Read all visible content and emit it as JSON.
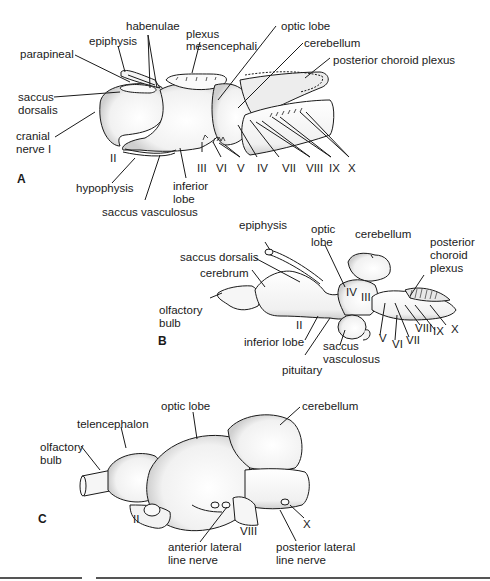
{
  "figure": {
    "panels": [
      {
        "id": "A",
        "letter": "A",
        "labels": {
          "habenulae": "habenulae",
          "epiphysis": "epiphysis",
          "parapineal": "parapineal",
          "plexus_mesencephali_1": "plexus",
          "plexus_mesencephali_2": "mesencephali",
          "optic_lobe": "optic lobe",
          "cerebellum": "cerebellum",
          "posterior_choroid_plexus": "posterior choroid plexus",
          "saccus_dorsalis_1": "saccus",
          "saccus_dorsalis_2": "dorsalis",
          "cranial_nerve_1": "cranial",
          "cranial_nerve_2": "nerve I",
          "nerve_II": "II",
          "hypophysis": "hypophysis",
          "inferior_lobe_1": "inferior",
          "inferior_lobe_2": "lobe",
          "saccus_vasculosus": "saccus vasculosus",
          "nerves": [
            "III",
            "VI",
            "V",
            "IV",
            "VII",
            "VIII",
            "IX",
            "X"
          ]
        }
      },
      {
        "id": "B",
        "letter": "B",
        "labels": {
          "epiphysis": "epiphysis",
          "optic_lobe_1": "optic",
          "optic_lobe_2": "lobe",
          "cerebellum": "cerebellum",
          "posterior_choroid_plexus_1": "posterior",
          "posterior_choroid_plexus_2": "choroid",
          "posterior_choroid_plexus_3": "plexus",
          "saccus_dorsalis": "saccus dorsalis",
          "cerebrum": "cerebrum",
          "olfactory_bulb_1": "olfactory",
          "olfactory_bulb_2": "bulb",
          "nerve_II": "II",
          "inferior_lobe": "inferior lobe",
          "pituitary": "pituitary",
          "saccus_vasculosus_1": "saccus",
          "saccus_vasculosus_2": "vasculosus",
          "nerve_IV": "IV",
          "nerve_III": "III",
          "nerve_V": "V",
          "nerve_VI": "VI",
          "nerve_VII": "VII",
          "nerve_VIII": "VIII",
          "nerve_IX": "IX",
          "nerve_X": "X"
        }
      },
      {
        "id": "C",
        "letter": "C",
        "labels": {
          "optic_lobe": "optic lobe",
          "cerebellum": "cerebellum",
          "telencephalon": "telencephalon",
          "olfactory_bulb_1": "olfactory",
          "olfactory_bulb_2": "bulb",
          "nerve_II": "II",
          "nerve_VIII": "VIII",
          "nerve_X": "X",
          "anterior_lateral_line_1": "anterior lateral",
          "anterior_lateral_line_2": "line nerve",
          "posterior_lateral_line_1": "posterior lateral",
          "posterior_lateral_line_2": "line nerve"
        }
      }
    ],
    "colors": {
      "ink": "#1a1a1a",
      "shade": "#d8d8d8",
      "rule": "#555555"
    }
  }
}
